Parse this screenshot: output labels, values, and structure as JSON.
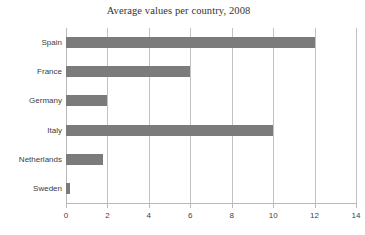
{
  "chart_data": {
    "type": "bar",
    "orientation": "horizontal",
    "title": "Average values per country, 2008",
    "xlabel": "",
    "ylabel": "",
    "categories": [
      "Spain",
      "France",
      "Germany",
      "Italy",
      "Netherlands",
      "Sweden"
    ],
    "values": [
      12,
      6,
      2,
      10,
      1.8,
      0.2
    ],
    "xlim": [
      0,
      14
    ],
    "xticks": [
      "0",
      "2",
      "4",
      "6",
      "8",
      "10",
      "12",
      "14"
    ],
    "xtick_values": [
      0,
      2,
      4,
      6,
      8,
      10,
      12,
      14
    ],
    "grid": "vertical",
    "legend": "none",
    "bar_color": "#7b7b7b",
    "grid_color": "#c2c2c2",
    "axis_color": "#b9b9b9",
    "title_color": "#333333",
    "label_color": "#3d3d3d",
    "background": "#ffffff"
  }
}
